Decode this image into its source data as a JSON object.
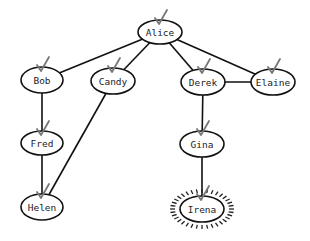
{
  "diagram": {
    "type": "tree",
    "colors": {
      "edge": "#111111",
      "node_stroke": "#111111",
      "node_fill": "#ffffff",
      "check": "#777777",
      "highlight_rays": "#222222"
    },
    "nodes": [
      {
        "id": "alice",
        "label": "Alice",
        "cx": 160,
        "cy": 32,
        "rx": 22,
        "ry": 12,
        "checked": true,
        "highlighted": false
      },
      {
        "id": "bob",
        "label": "Bob",
        "cx": 42,
        "cy": 80,
        "rx": 21,
        "ry": 13,
        "checked": true,
        "highlighted": false
      },
      {
        "id": "candy",
        "label": "Candy",
        "cx": 113,
        "cy": 81,
        "rx": 22,
        "ry": 13,
        "checked": true,
        "highlighted": false
      },
      {
        "id": "derek",
        "label": "Derek",
        "cx": 203,
        "cy": 82,
        "rx": 22,
        "ry": 13,
        "checked": true,
        "highlighted": false
      },
      {
        "id": "elaine",
        "label": "Elaine",
        "cx": 273,
        "cy": 82,
        "rx": 22,
        "ry": 13,
        "checked": true,
        "highlighted": false
      },
      {
        "id": "fred",
        "label": "Fred",
        "cx": 42,
        "cy": 143,
        "rx": 21,
        "ry": 12,
        "checked": true,
        "highlighted": false
      },
      {
        "id": "gina",
        "label": "Gina",
        "cx": 202,
        "cy": 144,
        "rx": 22,
        "ry": 13,
        "checked": true,
        "highlighted": false
      },
      {
        "id": "helen",
        "label": "Helen",
        "cx": 42,
        "cy": 207,
        "rx": 21,
        "ry": 13,
        "checked": true,
        "highlighted": false
      },
      {
        "id": "irena",
        "label": "Irena",
        "cx": 202,
        "cy": 209,
        "rx": 22,
        "ry": 13,
        "checked": true,
        "highlighted": true
      }
    ],
    "edges": [
      {
        "from": "alice",
        "to": "bob"
      },
      {
        "from": "alice",
        "to": "candy"
      },
      {
        "from": "alice",
        "to": "derek"
      },
      {
        "from": "alice",
        "to": "elaine"
      },
      {
        "from": "derek",
        "to": "elaine"
      },
      {
        "from": "bob",
        "to": "fred"
      },
      {
        "from": "fred",
        "to": "helen"
      },
      {
        "from": "candy",
        "to": "helen"
      },
      {
        "from": "derek",
        "to": "gina"
      },
      {
        "from": "gina",
        "to": "irena"
      }
    ]
  }
}
